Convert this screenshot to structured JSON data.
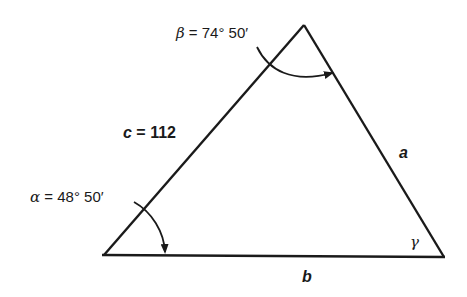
{
  "diagram": {
    "type": "triangle",
    "colors": {
      "stroke": "#1a1a1a",
      "background": "#ffffff"
    },
    "vertices": {
      "A": {
        "x": 104,
        "y": 255
      },
      "B": {
        "x": 304,
        "y": 25
      },
      "C": {
        "x": 444,
        "y": 257
      }
    },
    "labels": {
      "beta_symbol": "β",
      "beta_value": " = 74° 50′",
      "alpha_symbol": "α",
      "alpha_value": " = 48° 50′",
      "side_c_symbol": "c",
      "side_c_value": " = 112",
      "side_a": "a",
      "side_b": "b",
      "gamma": "γ"
    }
  }
}
